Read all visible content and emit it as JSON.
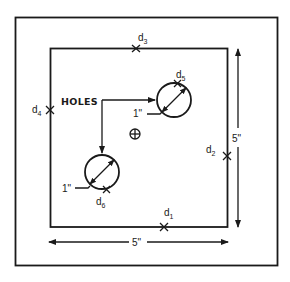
{
  "diagram": {
    "holes_label": "HOLES",
    "center_symbol": "centroid-crosshair-icon",
    "dimensions": {
      "width": "5\"",
      "height": "5\""
    },
    "holes": [
      {
        "id": "hole-1",
        "diameter_label": "1\"",
        "point": "d",
        "point_sub": "5"
      },
      {
        "id": "hole-2",
        "diameter_label": "1\"",
        "point": "d",
        "point_sub": "6"
      }
    ],
    "edge_points": [
      {
        "id": "d1",
        "main": "d",
        "sub": "1",
        "edge": "bottom"
      },
      {
        "id": "d2",
        "main": "d",
        "sub": "2",
        "edge": "right"
      },
      {
        "id": "d3",
        "main": "d",
        "sub": "3",
        "edge": "top"
      },
      {
        "id": "d4",
        "main": "d",
        "sub": "4",
        "edge": "left"
      }
    ],
    "colors": {
      "ink": "#1a1a1a",
      "background": "#ffffff"
    }
  }
}
